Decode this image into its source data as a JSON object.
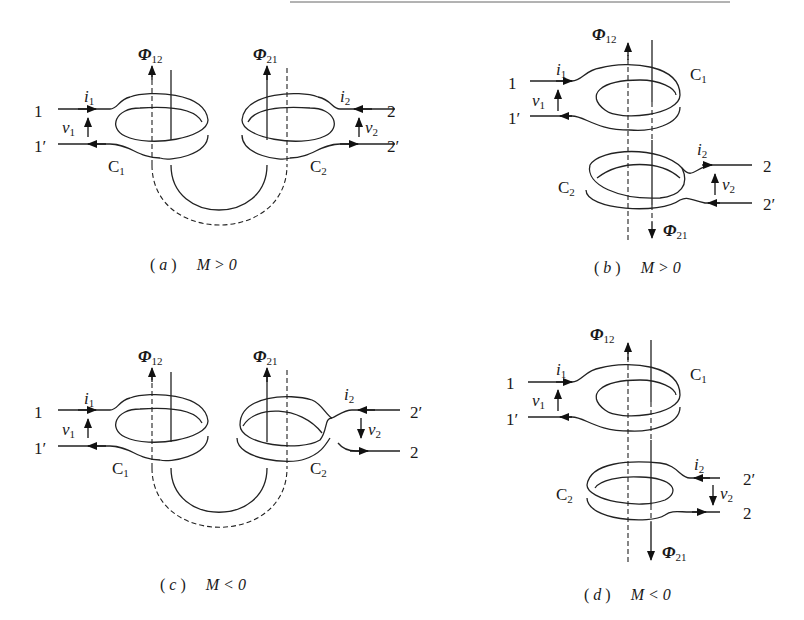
{
  "figure": {
    "panels": [
      {
        "id": "a",
        "caption_letter": "a",
        "caption_condition": "M > 0",
        "layout": "side-by-side coils",
        "labels": {
          "terminal_1": "1",
          "terminal_1p": "1′",
          "terminal_2": "2",
          "terminal_2p": "2′",
          "current_1": "i",
          "current_1_sub": "1",
          "current_2": "i",
          "current_2_sub": "2",
          "voltage_1": "v",
          "voltage_1_sub": "1",
          "voltage_2": "v",
          "voltage_2_sub": "2",
          "coil_1": "C",
          "coil_1_sub": "1",
          "coil_2": "C",
          "coil_2_sub": "2",
          "flux_12": "Φ",
          "flux_12_sub": "12",
          "flux_21": "Φ",
          "flux_21_sub": "21"
        }
      },
      {
        "id": "b",
        "caption_letter": "b",
        "caption_condition": "M > 0",
        "layout": "stacked coils",
        "labels": {
          "terminal_1": "1",
          "terminal_1p": "1′",
          "terminal_2": "2",
          "terminal_2p": "2′",
          "current_1": "i",
          "current_1_sub": "1",
          "current_2": "i",
          "current_2_sub": "2",
          "voltage_1": "v",
          "voltage_1_sub": "1",
          "voltage_2": "v",
          "voltage_2_sub": "2",
          "coil_1": "C",
          "coil_1_sub": "1",
          "coil_2": "C",
          "coil_2_sub": "2",
          "flux_12": "Φ",
          "flux_12_sub": "12",
          "flux_21": "Φ",
          "flux_21_sub": "21"
        }
      },
      {
        "id": "c",
        "caption_letter": "c",
        "caption_condition": "M < 0",
        "layout": "side-by-side coils",
        "labels": {
          "terminal_1": "1",
          "terminal_1p": "1′",
          "terminal_2": "2",
          "terminal_2p": "2′",
          "current_1": "i",
          "current_1_sub": "1",
          "current_2": "i",
          "current_2_sub": "2",
          "voltage_1": "v",
          "voltage_1_sub": "1",
          "voltage_2": "v",
          "voltage_2_sub": "2",
          "coil_1": "C",
          "coil_1_sub": "1",
          "coil_2": "C",
          "coil_2_sub": "2",
          "flux_12": "Φ",
          "flux_12_sub": "12",
          "flux_21": "Φ",
          "flux_21_sub": "21"
        }
      },
      {
        "id": "d",
        "caption_letter": "d",
        "caption_condition": "M < 0",
        "layout": "stacked coils",
        "labels": {
          "terminal_1": "1",
          "terminal_1p": "1′",
          "terminal_2": "2",
          "terminal_2p": "2′",
          "current_1": "i",
          "current_1_sub": "1",
          "current_2": "i",
          "current_2_sub": "2",
          "voltage_1": "v",
          "voltage_1_sub": "1",
          "voltage_2": "v",
          "voltage_2_sub": "2",
          "coil_1": "C",
          "coil_1_sub": "1",
          "coil_2": "C",
          "coil_2_sub": "2",
          "flux_12": "Φ",
          "flux_12_sub": "12",
          "flux_21": "Φ",
          "flux_21_sub": "21"
        }
      }
    ],
    "caption_open": "(",
    "caption_close": ")"
  }
}
